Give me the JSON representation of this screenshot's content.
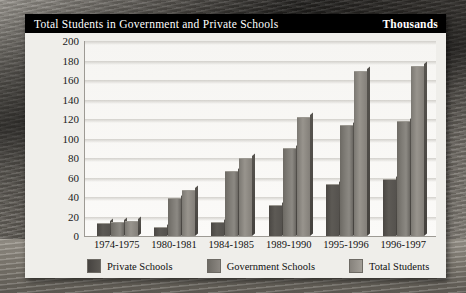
{
  "chart": {
    "title": "Total Students in Government and Private Schools",
    "units": "Thousands"
  },
  "legend": [
    {
      "label": "Private Schools",
      "swatch": "private-swatch"
    },
    {
      "label": "Government Schools",
      "swatch": "government-swatch"
    },
    {
      "label": "Total Students",
      "swatch": "total-swatch"
    }
  ],
  "chart_data": {
    "type": "bar",
    "title": "Total Students in Government and Private Schools",
    "subtitle": "Thousands",
    "xlabel": "",
    "ylabel": "Thousands",
    "ylim": [
      0,
      200
    ],
    "yticks": [
      0,
      20,
      40,
      60,
      80,
      100,
      120,
      140,
      160,
      180,
      200
    ],
    "grid": true,
    "legend_position": "bottom",
    "categories": [
      "1974-1975",
      "1980-1981",
      "1984-1985",
      "1989-1990",
      "1995-1996",
      "1996-1997"
    ],
    "series": [
      {
        "name": "Private Schools",
        "values": [
          12,
          8,
          13,
          31,
          52,
          57
        ]
      },
      {
        "name": "Government Schools",
        "values": [
          13,
          38,
          66,
          89,
          113,
          117
        ]
      },
      {
        "name": "Total Students",
        "values": [
          14,
          46,
          79,
          121,
          168,
          173
        ]
      }
    ]
  }
}
